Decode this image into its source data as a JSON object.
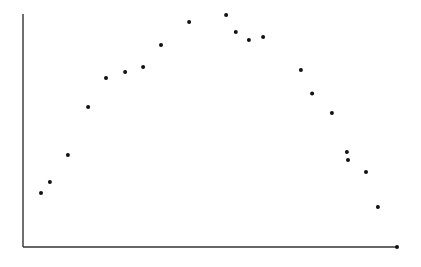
{
  "chart_data": {
    "type": "scatter",
    "title": "",
    "xlabel": "",
    "ylabel": "",
    "grid": false,
    "legend": null,
    "axes": {
      "x_pixel_range": [
        23,
        397
      ],
      "y_pixel_range": [
        247,
        14
      ],
      "tick_labels": false
    },
    "xlim": [
      0,
      100
    ],
    "ylim": [
      0,
      100
    ],
    "note": "Unlabeled axes; values estimated as percentage of axis extent (x from left axis, y from bottom axis). Inverted-U pattern.",
    "points": [
      {
        "x": 4.8,
        "y": 21.9
      },
      {
        "x": 7.2,
        "y": 26.3
      },
      {
        "x": 12.0,
        "y": 37.2
      },
      {
        "x": 17.4,
        "y": 56.7
      },
      {
        "x": 22.2,
        "y": 68.4
      },
      {
        "x": 27.3,
        "y": 70.9
      },
      {
        "x": 32.1,
        "y": 72.9
      },
      {
        "x": 36.9,
        "y": 81.8
      },
      {
        "x": 44.4,
        "y": 91.1
      },
      {
        "x": 54.3,
        "y": 93.9
      },
      {
        "x": 56.9,
        "y": 87.0
      },
      {
        "x": 60.4,
        "y": 83.8
      },
      {
        "x": 64.2,
        "y": 85.0
      },
      {
        "x": 74.3,
        "y": 71.7
      },
      {
        "x": 77.3,
        "y": 62.1
      },
      {
        "x": 82.6,
        "y": 54.3
      },
      {
        "x": 86.6,
        "y": 38.5
      },
      {
        "x": 86.9,
        "y": 35.2
      },
      {
        "x": 91.7,
        "y": 30.4
      },
      {
        "x": 94.9,
        "y": 16.2
      }
    ],
    "pixel_points": [
      [
        41,
        196
      ],
      [
        50,
        185
      ],
      [
        68,
        158
      ],
      [
        88,
        107
      ],
      [
        106,
        78
      ],
      [
        125,
        72
      ],
      [
        143,
        67
      ],
      [
        161,
        45
      ],
      [
        189,
        22
      ],
      [
        226,
        15
      ],
      [
        236,
        32
      ],
      [
        249,
        40
      ],
      [
        263,
        37
      ],
      [
        301,
        70
      ],
      [
        312,
        94
      ],
      [
        332,
        113
      ],
      [
        347,
        152
      ],
      [
        346,
        161
      ],
      [
        366,
        173
      ],
      [
        378,
        208
      ]
    ],
    "axis_end_marker": [
      397,
      247
    ]
  }
}
